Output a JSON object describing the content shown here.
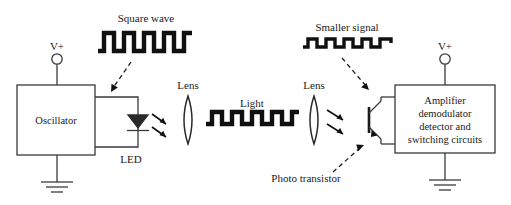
{
  "diagram": {
    "background_color": "#ffffff",
    "line_color": "#3a3a3a",
    "wave_color": "#101010",
    "text_color": "#1a1a1a",
    "labels": {
      "square_wave": "Square wave",
      "smaller_signal": "Smaller signal",
      "light": "Light",
      "lens_left": "Lens",
      "lens_right": "Lens",
      "led": "LED",
      "photo_transistor": "Photo transistor",
      "v_plus_left": "V+",
      "v_plus_right": "V+"
    },
    "blocks": [
      {
        "name": "oscillator",
        "lines": [
          "Oscillator"
        ]
      },
      {
        "name": "amplifier",
        "lines": [
          "Amplifier",
          "demodulator",
          "detector and",
          "switching circuits"
        ]
      }
    ],
    "amplifier_lines": {
      "line1": "Amplifier",
      "line2": "demodulator",
      "line3": "detector and",
      "line4": "switching circuits"
    },
    "components": [
      "oscillator-block",
      "led-diode",
      "lens-left",
      "lens-right",
      "photo-transistor",
      "amplifier-block",
      "ground-left",
      "ground-right",
      "v-plus-left",
      "v-plus-right"
    ],
    "waveforms": [
      {
        "name": "square-wave",
        "label": "Square wave",
        "pulses": 5,
        "amplitude": "large"
      },
      {
        "name": "light-wave",
        "label": "Light",
        "pulses": 5,
        "amplitude": "large"
      },
      {
        "name": "smaller-signal-wave",
        "label": "Smaller signal",
        "pulses": 5,
        "amplitude": "small"
      }
    ]
  }
}
